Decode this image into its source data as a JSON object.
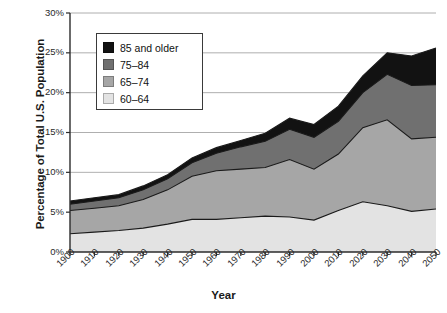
{
  "chart_data": {
    "type": "area",
    "title": "",
    "subtitle": "",
    "xlabel": "Year",
    "ylabel": "Percentage of Total U.S. Population",
    "stacked": true,
    "grid": true,
    "legend_position": "top-left-inset",
    "xlim": [
      1900,
      2050
    ],
    "ylim": [
      0,
      30
    ],
    "ytick_labels": [
      "0%",
      "5%",
      "10%",
      "15%",
      "20%",
      "25%",
      "30%"
    ],
    "ytick_values": [
      0,
      5,
      10,
      15,
      20,
      25,
      30
    ],
    "categories": [
      1900,
      1910,
      1920,
      1930,
      1940,
      1950,
      1960,
      1970,
      1980,
      1990,
      2000,
      2010,
      2020,
      2030,
      2040,
      2050
    ],
    "xtick_labels": [
      "1900",
      "1910",
      "1920",
      "1930",
      "1940",
      "1950",
      "1960",
      "1970",
      "1980",
      "1990",
      "2000",
      "2010",
      "2020",
      "2030",
      "2040",
      "2050"
    ],
    "series": [
      {
        "name": "60–64",
        "color": "#e3e3e3",
        "values": [
          2.3,
          2.5,
          2.7,
          3.0,
          3.5,
          4.1,
          4.1,
          4.3,
          4.5,
          4.4,
          4.0,
          5.2,
          6.3,
          5.8,
          5.1,
          5.4
        ]
      },
      {
        "name": "65–74",
        "color": "#a6a6a6",
        "values": [
          2.9,
          3.0,
          3.1,
          3.6,
          4.3,
          5.4,
          6.1,
          6.1,
          6.1,
          7.2,
          6.4,
          7.1,
          9.3,
          10.8,
          9.1,
          9.0
        ]
      },
      {
        "name": "75–84",
        "color": "#707070",
        "values": [
          0.8,
          0.9,
          1.0,
          1.2,
          1.4,
          1.7,
          2.2,
          2.8,
          3.3,
          3.8,
          4.0,
          4.1,
          4.4,
          5.7,
          6.7,
          6.6
        ]
      },
      {
        "name": "85 and older",
        "color": "#121212",
        "values": [
          0.4,
          0.4,
          0.4,
          0.5,
          0.5,
          0.6,
          0.7,
          0.8,
          1.0,
          1.4,
          1.6,
          1.9,
          2.1,
          2.7,
          3.7,
          4.6
        ]
      }
    ],
    "legend_entries": [
      {
        "label": "85 and older",
        "color": "#121212"
      },
      {
        "label": "75–84",
        "color": "#707070"
      },
      {
        "label": "65–74",
        "color": "#a6a6a6"
      },
      {
        "label": "60–64",
        "color": "#e3e3e3"
      }
    ],
    "totals": [
      6.4,
      6.8,
      7.2,
      8.3,
      9.7,
      11.8,
      13.1,
      14.0,
      14.9,
      16.8,
      16.0,
      18.3,
      22.1,
      25.0,
      24.6,
      25.6
    ]
  }
}
